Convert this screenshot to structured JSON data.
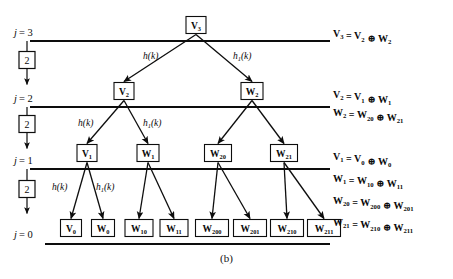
{
  "figure": {
    "caption": "(b)",
    "type": "wavelet-packet-decomposition-tree"
  },
  "levels": [
    {
      "id": "j3",
      "label_prefix": "j",
      "label_eq": "= 3",
      "y": 36
    },
    {
      "id": "j2",
      "label_prefix": "j",
      "label_eq": "= 2",
      "y": 102
    },
    {
      "id": "j1",
      "label_prefix": "j",
      "label_eq": "= 1",
      "y": 164
    },
    {
      "id": "j0",
      "label_prefix": "j",
      "label_eq": "= 0",
      "y": 238
    }
  ],
  "downsamplers": [
    {
      "id": "ds1",
      "label": "2",
      "x": 27,
      "y": 60
    },
    {
      "id": "ds2",
      "label": "2",
      "x": 27,
      "y": 124
    },
    {
      "id": "ds3",
      "label": "2",
      "x": 27,
      "y": 189
    }
  ],
  "nodes": [
    {
      "id": "V3",
      "base": "V",
      "sub": "3",
      "x": 196,
      "y": 25,
      "w": 20,
      "h": 17
    },
    {
      "id": "V2",
      "base": "V",
      "sub": "2",
      "x": 124,
      "y": 91,
      "w": 20,
      "h": 17
    },
    {
      "id": "W2",
      "base": "W",
      "sub": "2",
      "x": 252,
      "y": 91,
      "w": 22,
      "h": 17
    },
    {
      "id": "V1",
      "base": "V",
      "sub": "1",
      "x": 87,
      "y": 153,
      "w": 20,
      "h": 17
    },
    {
      "id": "W1",
      "base": "W",
      "sub": "1",
      "x": 148,
      "y": 153,
      "w": 22,
      "h": 17
    },
    {
      "id": "W20",
      "base": "W",
      "sub": "20",
      "x": 218,
      "y": 153,
      "w": 27,
      "h": 17
    },
    {
      "id": "W21",
      "base": "W",
      "sub": "21",
      "x": 284,
      "y": 153,
      "w": 27,
      "h": 17
    },
    {
      "id": "V0",
      "base": "V",
      "sub": "0",
      "x": 71,
      "y": 228,
      "w": 21,
      "h": 17
    },
    {
      "id": "W0",
      "base": "W",
      "sub": "0",
      "x": 103,
      "y": 228,
      "w": 23,
      "h": 17
    },
    {
      "id": "W10",
      "base": "W",
      "sub": "10",
      "x": 139,
      "y": 228,
      "w": 28,
      "h": 17
    },
    {
      "id": "W11",
      "base": "W",
      "sub": "11",
      "x": 174,
      "y": 228,
      "w": 28,
      "h": 17
    },
    {
      "id": "W200",
      "base": "W",
      "sub": "200",
      "x": 212,
      "y": 228,
      "w": 33,
      "h": 17
    },
    {
      "id": "W201",
      "base": "W",
      "sub": "201",
      "x": 250,
      "y": 228,
      "w": 33,
      "h": 17
    },
    {
      "id": "W210",
      "base": "W",
      "sub": "210",
      "x": 287,
      "y": 228,
      "w": 33,
      "h": 17
    },
    {
      "id": "W211",
      "base": "W",
      "sub": "211",
      "x": 324,
      "y": 228,
      "w": 33,
      "h": 17
    }
  ],
  "edges": [
    {
      "from": "V3",
      "to": "V2",
      "filter": "h"
    },
    {
      "from": "V3",
      "to": "W2",
      "filter": "h1"
    },
    {
      "from": "V2",
      "to": "V1",
      "filter": "h"
    },
    {
      "from": "V2",
      "to": "W1",
      "filter": "h1"
    },
    {
      "from": "W2",
      "to": "W20",
      "filter": "h"
    },
    {
      "from": "W2",
      "to": "W21",
      "filter": "h1"
    },
    {
      "from": "V1",
      "to": "V0",
      "filter": "h"
    },
    {
      "from": "V1",
      "to": "W0",
      "filter": "h1"
    },
    {
      "from": "W1",
      "to": "W10",
      "filter": "h"
    },
    {
      "from": "W1",
      "to": "W11",
      "filter": "h1"
    },
    {
      "from": "W20",
      "to": "W200",
      "filter": "h"
    },
    {
      "from": "W20",
      "to": "W201",
      "filter": "h1"
    },
    {
      "from": "W21",
      "to": "W210",
      "filter": "h"
    },
    {
      "from": "W21",
      "to": "W211",
      "filter": "h1"
    }
  ],
  "filter_labels": [
    {
      "id": "f1",
      "base": "h",
      "sub": "",
      "arg": "(k)",
      "x": 143,
      "y": 59
    },
    {
      "id": "f2",
      "base": "h",
      "sub": "1",
      "arg": "(k)",
      "x": 233,
      "y": 59
    },
    {
      "id": "f3",
      "base": "h",
      "sub": "",
      "arg": "(k)",
      "x": 78,
      "y": 126
    },
    {
      "id": "f4",
      "base": "h",
      "sub": "1",
      "arg": "(k)",
      "x": 143,
      "y": 126
    },
    {
      "id": "f5",
      "base": "h",
      "sub": "",
      "arg": "(k)",
      "x": 52,
      "y": 190
    },
    {
      "id": "f6",
      "base": "h",
      "sub": "1",
      "arg": "(k)",
      "x": 96,
      "y": 190
    }
  ],
  "equations": [
    {
      "id": "eq-v3",
      "x": 333,
      "y": 37,
      "parts": [
        {
          "t": "V",
          "s": "3"
        },
        {
          "t": " = "
        },
        {
          "t": "V",
          "s": "2"
        },
        {
          "t": " ⊕ "
        },
        {
          "t": "W",
          "s": "2"
        }
      ],
      "plain": "V3 = V2 ⊕ W2"
    },
    {
      "id": "eq-v2",
      "x": 333,
      "y": 98,
      "parts": [
        {
          "t": "V",
          "s": "2"
        },
        {
          "t": " = "
        },
        {
          "t": "V",
          "s": "1"
        },
        {
          "t": " ⊕ "
        },
        {
          "t": "W",
          "s": "1"
        }
      ],
      "plain": "V2 = V1 ⊕ W1"
    },
    {
      "id": "eq-w2",
      "x": 333,
      "y": 116,
      "parts": [
        {
          "t": "W",
          "s": "2"
        },
        {
          "t": " = "
        },
        {
          "t": "W",
          "s": "20"
        },
        {
          "t": " ⊕ "
        },
        {
          "t": "W",
          "s": "21"
        }
      ],
      "plain": "W2 = W20 ⊕ W21"
    },
    {
      "id": "eq-v1",
      "x": 333,
      "y": 160,
      "parts": [
        {
          "t": "V",
          "s": "1"
        },
        {
          "t": " = "
        },
        {
          "t": "V",
          "s": "0"
        },
        {
          "t": " ⊕ "
        },
        {
          "t": "W",
          "s": "0"
        }
      ],
      "plain": "V1 = V0 ⊕ W0"
    },
    {
      "id": "eq-w1",
      "x": 333,
      "y": 182,
      "parts": [
        {
          "t": "W",
          "s": "1"
        },
        {
          "t": " = "
        },
        {
          "t": "W",
          "s": "10"
        },
        {
          "t": " ⊕ "
        },
        {
          "t": "W",
          "s": "11"
        }
      ],
      "plain": "W1 = W10 ⊕ W11"
    },
    {
      "id": "eq-w20",
      "x": 333,
      "y": 204,
      "parts": [
        {
          "t": "W",
          "s": "20"
        },
        {
          "t": " = "
        },
        {
          "t": "W",
          "s": "200"
        },
        {
          "t": " ⊕ "
        },
        {
          "t": "W",
          "s": "201"
        }
      ],
      "plain": "W20 = W200 ⊕ W201"
    },
    {
      "id": "eq-w21",
      "x": 333,
      "y": 226,
      "parts": [
        {
          "t": "W",
          "s": "21"
        },
        {
          "t": " = "
        },
        {
          "t": "W",
          "s": "210"
        },
        {
          "t": " ⊕ "
        },
        {
          "t": "W",
          "s": "211"
        }
      ],
      "plain": "W21 = W210 ⊕ W211"
    }
  ],
  "rails": [
    {
      "id": "rail-j3",
      "x1": 30,
      "x2": 330,
      "y": 41
    },
    {
      "id": "rail-j2",
      "x1": 30,
      "x2": 330,
      "y": 107
    },
    {
      "id": "rail-j1",
      "x1": 30,
      "x2": 330,
      "y": 169
    },
    {
      "id": "rail-j0",
      "x1": 45,
      "x2": 330,
      "y": 244
    }
  ],
  "colors": {
    "ink": "#0d0d0d",
    "paper": "#ffffff"
  }
}
